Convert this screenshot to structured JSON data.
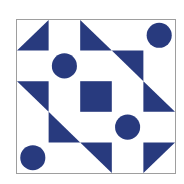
{
  "puzzle": {
    "type": "quilt-block",
    "grid": {
      "rows": 5,
      "cols": 5
    },
    "colors": {
      "fill": "#283a7e",
      "background": "#ffffff",
      "border": "#9e9e9e"
    },
    "cells": [
      {
        "row": 0,
        "col": 0,
        "shape": "triangle",
        "corner": "bottom-right"
      },
      {
        "row": 0,
        "col": 2,
        "shape": "triangle",
        "corner": "bottom-left"
      },
      {
        "row": 0,
        "col": 4,
        "shape": "circle"
      },
      {
        "row": 1,
        "col": 1,
        "shape": "circle"
      },
      {
        "row": 1,
        "col": 3,
        "shape": "triangle",
        "corner": "top-right"
      },
      {
        "row": 2,
        "col": 0,
        "shape": "triangle",
        "corner": "top-right"
      },
      {
        "row": 2,
        "col": 2,
        "shape": "square"
      },
      {
        "row": 2,
        "col": 4,
        "shape": "triangle",
        "corner": "bottom-left"
      },
      {
        "row": 3,
        "col": 1,
        "shape": "triangle",
        "corner": "bottom-left"
      },
      {
        "row": 3,
        "col": 3,
        "shape": "circle"
      },
      {
        "row": 4,
        "col": 0,
        "shape": "circle"
      },
      {
        "row": 4,
        "col": 2,
        "shape": "triangle",
        "corner": "top-right"
      },
      {
        "row": 4,
        "col": 4,
        "shape": "triangle",
        "corner": "top-left"
      }
    ]
  }
}
